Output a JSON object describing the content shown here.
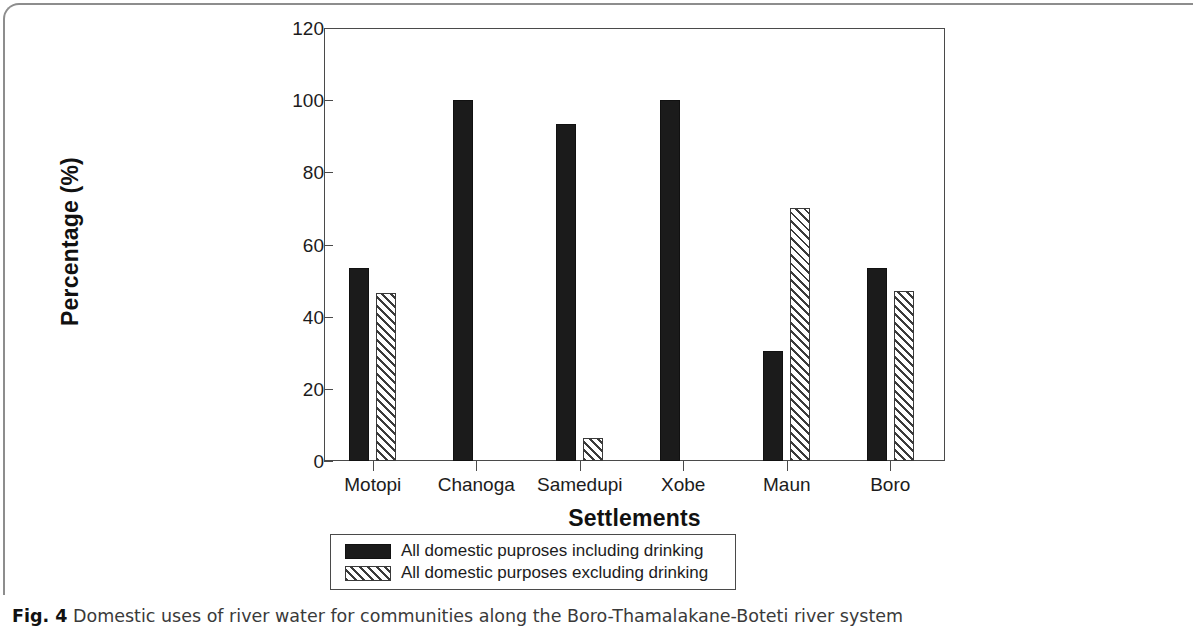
{
  "chart_data": {
    "type": "bar",
    "title": "",
    "xlabel": "Settlements",
    "ylabel": "Percentage (%)",
    "categories": [
      "Motopi",
      "Chanoga",
      "Samedupi",
      "Xobe",
      "Maun",
      "Boro"
    ],
    "series": [
      {
        "name": "All domestic puproses including drinking",
        "pattern": "solid-black",
        "color": "#1b1b1b",
        "values": [
          53.5,
          100,
          93.5,
          100,
          30.5,
          53.5
        ]
      },
      {
        "name": "All domestic purposes excluding drinking",
        "pattern": "diagonal-hatch",
        "color": "#3b3b3b",
        "values": [
          46.5,
          0,
          6.5,
          0,
          70,
          47
        ]
      }
    ],
    "ylim": [
      0,
      120
    ],
    "yticks": [
      0,
      20,
      40,
      60,
      80,
      100,
      120
    ],
    "ytick_labels": [
      "0",
      "20",
      "40",
      "60",
      "80",
      "100",
      "120"
    ],
    "grid": false,
    "legend_position": "below-axis-center"
  },
  "axes": {
    "y_title": "Percentage (%)",
    "x_title": "Settlements"
  },
  "legend": {
    "entries": [
      {
        "swatch": "solid-black-swatch",
        "label": "All domestic puproses including drinking"
      },
      {
        "swatch": "hatched-swatch",
        "label": "All domestic purposes excluding drinking"
      }
    ]
  },
  "caption": {
    "figure_number": "Fig. 4",
    "text": " Domestic uses of river water for communities along the Boro-Thamalakane-Boteti river system"
  }
}
